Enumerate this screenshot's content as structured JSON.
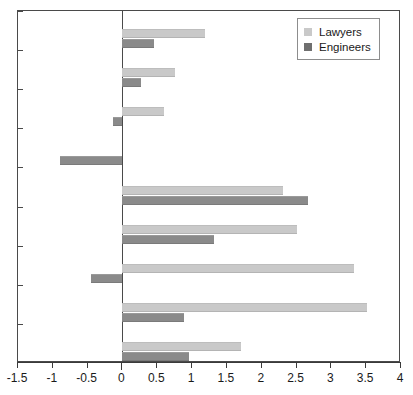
{
  "chart_data": {
    "type": "bar",
    "orientation": "horizontal",
    "title": "",
    "subtitle": "",
    "xlabel": "",
    "ylabel": "",
    "xlim": [
      -1.5,
      4
    ],
    "xticks": [
      -1.5,
      -1,
      -0.5,
      0,
      0.5,
      1,
      1.5,
      2,
      2.5,
      3,
      3.5,
      4
    ],
    "xtick_labels": [
      "-1.5",
      "-1",
      "-0.5",
      "0",
      "0.5",
      "1",
      "1.5",
      "2",
      "2.5",
      "3",
      "3.5",
      "4"
    ],
    "grid": false,
    "zero_reference_line": true,
    "legend_position": "top-right",
    "categories": [
      "Number of\norganizations",
      "Number of\npolitical staff",
      "Organization\nprominence",
      "Population size",
      "Socioeconomic\nstatus",
      "Media\nattentiveness",
      "Internal efficacy",
      "Civic engagement",
      "Voting rate"
    ],
    "series": [
      {
        "name": "Lawyers",
        "color": "#c9c9c9",
        "values": [
          1.18,
          0.76,
          0.6,
          0.0,
          2.31,
          2.51,
          3.33,
          3.51,
          1.7
        ]
      },
      {
        "name": "Engineers",
        "color": "#8a8a8a",
        "values": [
          0.46,
          0.27,
          -0.13,
          -0.9,
          2.67,
          1.32,
          -0.45,
          0.89,
          0.95
        ]
      }
    ]
  },
  "legend": {
    "items": [
      {
        "label": "Lawyers",
        "swatch": "light-gray-swatch"
      },
      {
        "label": "Engineers",
        "swatch": "dark-gray-swatch"
      }
    ]
  }
}
